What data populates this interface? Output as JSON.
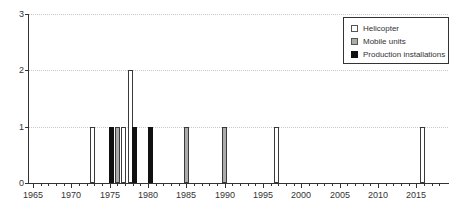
{
  "chart_data": {
    "type": "bar",
    "title": "",
    "xlabel": "",
    "ylabel": "",
    "grid": "horizontal-dotted",
    "legend_position": "top-right",
    "background_color": "#ffffff",
    "axis_color": "#333333",
    "grid_color": "#c9c9c9",
    "text_color": "#333333",
    "ylim": [
      0,
      3
    ],
    "y_ticks": [
      "0",
      "1",
      "2",
      "3"
    ],
    "x_range_years": [
      1965,
      2018
    ],
    "x_tick_labels": [
      "1965",
      "1970",
      "1975",
      "1980",
      "1985",
      "1990",
      "1995",
      "2000",
      "2005",
      "2010",
      "2015"
    ],
    "x_label_interval": 5,
    "series": [
      {
        "name": "Helicopter",
        "fill": "#ffffff",
        "border": "#3a3a3a",
        "points": [
          {
            "year": 1973,
            "value": 1
          },
          {
            "year": 1977,
            "value": 1
          },
          {
            "year": 1978,
            "value": 2
          },
          {
            "year": 1997,
            "value": 1
          },
          {
            "year": 2016,
            "value": 1
          }
        ]
      },
      {
        "name": "Mobile units",
        "fill": "#ababab",
        "border": "#3a3a3a",
        "points": [
          {
            "year": 1976,
            "value": 1
          },
          {
            "year": 1985,
            "value": 1
          },
          {
            "year": 1990,
            "value": 1
          }
        ]
      },
      {
        "name": "Production installations",
        "fill": "#111111",
        "border": "#111111",
        "points": [
          {
            "year": 1975,
            "value": 1
          },
          {
            "year": 1978,
            "value": 1
          },
          {
            "year": 1980,
            "value": 1
          }
        ]
      }
    ]
  }
}
